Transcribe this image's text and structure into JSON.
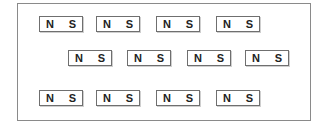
{
  "diagram": {
    "rows": [
      {
        "magnets": [
          {
            "x": 39,
            "y": 16,
            "north": "N",
            "south": "S"
          },
          {
            "x": 96,
            "y": 16,
            "north": "N",
            "south": "S"
          },
          {
            "x": 156,
            "y": 16,
            "north": "N",
            "south": "S"
          },
          {
            "x": 216,
            "y": 16,
            "north": "N",
            "south": "S"
          }
        ]
      },
      {
        "magnets": [
          {
            "x": 68,
            "y": 50,
            "north": "N",
            "south": "S"
          },
          {
            "x": 127,
            "y": 50,
            "north": "N",
            "south": "S"
          },
          {
            "x": 187,
            "y": 50,
            "north": "N",
            "south": "S"
          },
          {
            "x": 245,
            "y": 50,
            "north": "N",
            "south": "S"
          }
        ]
      },
      {
        "magnets": [
          {
            "x": 39,
            "y": 90,
            "north": "N",
            "south": "S"
          },
          {
            "x": 96,
            "y": 90,
            "north": "N",
            "south": "S"
          },
          {
            "x": 156,
            "y": 90,
            "north": "N",
            "south": "S"
          },
          {
            "x": 216,
            "y": 90,
            "north": "N",
            "south": "S"
          }
        ]
      }
    ]
  }
}
